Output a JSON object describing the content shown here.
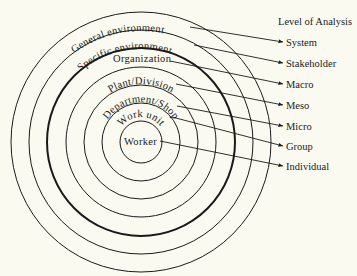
{
  "diagram": {
    "title": "Level of Analysis",
    "center": [
      141,
      142
    ],
    "colors": {
      "background": "#fbfaf0",
      "stroke": "#1a1a1a"
    },
    "rings": [
      {
        "label": "Worker",
        "radius": 21,
        "thick": false,
        "level": "Individual"
      },
      {
        "label": "Work unit",
        "radius": 39,
        "thick": false,
        "level": "Group"
      },
      {
        "label": "Department/Shop",
        "radius": 57,
        "thick": false,
        "level": "Micro"
      },
      {
        "label": "Plant/Division",
        "radius": 75,
        "thick": false,
        "level": "Meso"
      },
      {
        "label": "Organization",
        "radius": 94,
        "thick": true,
        "level": "Macro"
      },
      {
        "label": "Specific environment",
        "radius": 112,
        "thick": false,
        "level": "Stakeholder"
      },
      {
        "label": "General environment",
        "radius": 130,
        "thick": false,
        "level": "System"
      }
    ],
    "levels": [
      "System",
      "Stakeholder",
      "Macro",
      "Meso",
      "Micro",
      "Group",
      "Individual"
    ]
  }
}
